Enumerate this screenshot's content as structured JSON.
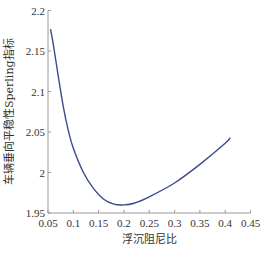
{
  "chart_data": {
    "type": "line",
    "title": "",
    "xlabel": "浮沉阻尼比",
    "ylabel": "车辆垂向平稳性Sperling指标",
    "xlim": [
      0.05,
      0.45
    ],
    "ylim": [
      1.95,
      2.2
    ],
    "xticks": [
      "0.05",
      "0.1",
      "0.15",
      "0.2",
      "0.25",
      "0.3",
      "0.35",
      "0.4",
      "0.45"
    ],
    "yticks": [
      "1.95",
      "2",
      "2.05",
      "2.1",
      "2.15",
      "2.2"
    ],
    "grid": false,
    "legend": null,
    "series": [
      {
        "name": "Sperling指标",
        "color": "#3c4a8c",
        "x": [
          0.055,
          0.06,
          0.07,
          0.08,
          0.09,
          0.1,
          0.12,
          0.14,
          0.16,
          0.18,
          0.2,
          0.22,
          0.25,
          0.3,
          0.35,
          0.4,
          0.41
        ],
        "y": [
          2.177,
          2.16,
          2.12,
          2.082,
          2.052,
          2.03,
          2.0,
          1.98,
          1.967,
          1.961,
          1.96,
          1.962,
          1.97,
          1.987,
          2.01,
          2.036,
          2.043
        ]
      }
    ]
  },
  "layout": {
    "plot": {
      "left": 48,
      "right": 250.5,
      "top": 10.5,
      "bottom": 213
    },
    "axis_color": "#999999"
  }
}
